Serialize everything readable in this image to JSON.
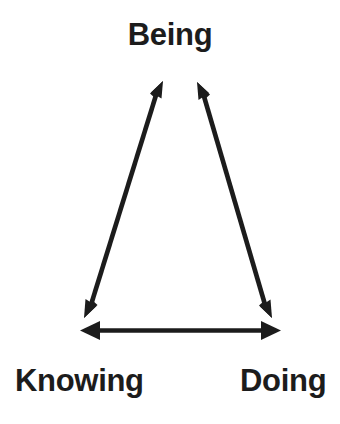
{
  "figure": {
    "kind": "triangle-relationship-diagram",
    "background_color": "#ffffff",
    "stroke_color": "#1c1c1c",
    "text_color": "#1c1c1c"
  },
  "nodes": {
    "top": {
      "label": "Being"
    },
    "bottom_left": {
      "label": "Knowing"
    },
    "bottom_right": {
      "label": "Doing"
    }
  },
  "edges": [
    {
      "name": "being-knowing",
      "from": "Being",
      "to": "Knowing",
      "arrows": "both"
    },
    {
      "name": "being-doing",
      "from": "Being",
      "to": "Doing",
      "arrows": "both"
    },
    {
      "name": "knowing-doing",
      "from": "Knowing",
      "to": "Doing",
      "arrows": "both"
    }
  ]
}
